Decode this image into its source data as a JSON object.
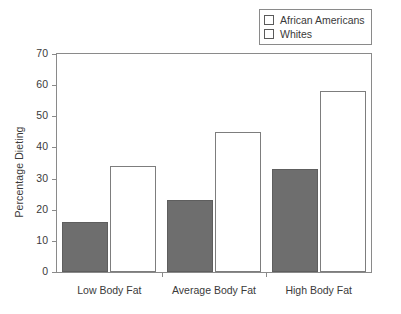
{
  "chart_data": {
    "type": "bar",
    "title": "",
    "subtitle": "",
    "xlabel": "",
    "ylabel": "Percentage Dieting",
    "categories": [
      "Low Body Fat",
      "Average Body Fat",
      "High Body Fat"
    ],
    "series": [
      {
        "name": "African Americans",
        "values": [
          16,
          23,
          33
        ],
        "color": "#6e6e6e"
      },
      {
        "name": "Whites",
        "values": [
          34,
          45,
          58
        ],
        "color": "#ffffff"
      }
    ],
    "ylim": [
      0,
      70
    ],
    "yticks": [
      0,
      10,
      20,
      30,
      40,
      50,
      60,
      70
    ],
    "ytick_labels": [
      "0",
      "10",
      "20",
      "30",
      "40",
      "50",
      "60",
      "70"
    ],
    "grid": false,
    "legend_position": "top-right",
    "legend_entries": [
      "African Americans",
      "Whites"
    ]
  },
  "legend": {
    "items": [
      {
        "label": "African Americans",
        "swatch": "filled-gray-swatch-icon"
      },
      {
        "label": "Whites",
        "swatch": "empty-white-swatch-icon"
      }
    ]
  },
  "axes": {
    "y_title": "Percentage Dieting"
  }
}
